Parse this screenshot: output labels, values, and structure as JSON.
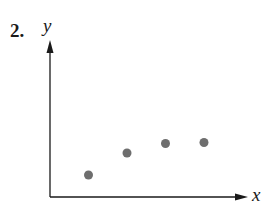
{
  "problem_number": "2.",
  "chart_data": {
    "type": "scatter",
    "title": "",
    "xlabel": "x",
    "ylabel": "y",
    "grid": false,
    "ticks": "none",
    "points": [
      {
        "x": 1,
        "y": 1.0
      },
      {
        "x": 2,
        "y": 3.1
      },
      {
        "x": 3,
        "y": 4.0
      },
      {
        "x": 4,
        "y": 4.1
      }
    ],
    "point_color": "#6e6e6e",
    "axis_color": "#1a1a1a"
  }
}
